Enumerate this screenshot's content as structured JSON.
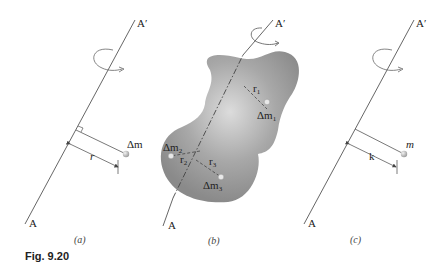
{
  "figure": {
    "caption": "Fig. 9.20",
    "panels": [
      {
        "id": "a",
        "label": "(a)",
        "axis_top_label": "A′",
        "axis_bottom_label": "A",
        "mass_label": "Δm",
        "distance_label": "r"
      },
      {
        "id": "b",
        "label": "(b)",
        "axis_top_label": "A′",
        "axis_bottom_label": "A",
        "masses": [
          {
            "label": "Δm",
            "sub": "1",
            "distance": "r",
            "distance_sub": "1"
          },
          {
            "label": "Δm",
            "sub": "2",
            "distance": "r",
            "distance_sub": "2"
          },
          {
            "label": "Δm",
            "sub": "3",
            "distance": "r",
            "distance_sub": "3"
          }
        ]
      },
      {
        "id": "c",
        "label": "(c)",
        "axis_top_label": "A′",
        "axis_bottom_label": "A",
        "mass_label": "m",
        "distance_label": "k"
      }
    ]
  },
  "colors": {
    "line": "#555555",
    "body_fill": "#9a9a9a",
    "body_highlight": "#d8d8d8",
    "mass_point": "#c8c8c8"
  }
}
